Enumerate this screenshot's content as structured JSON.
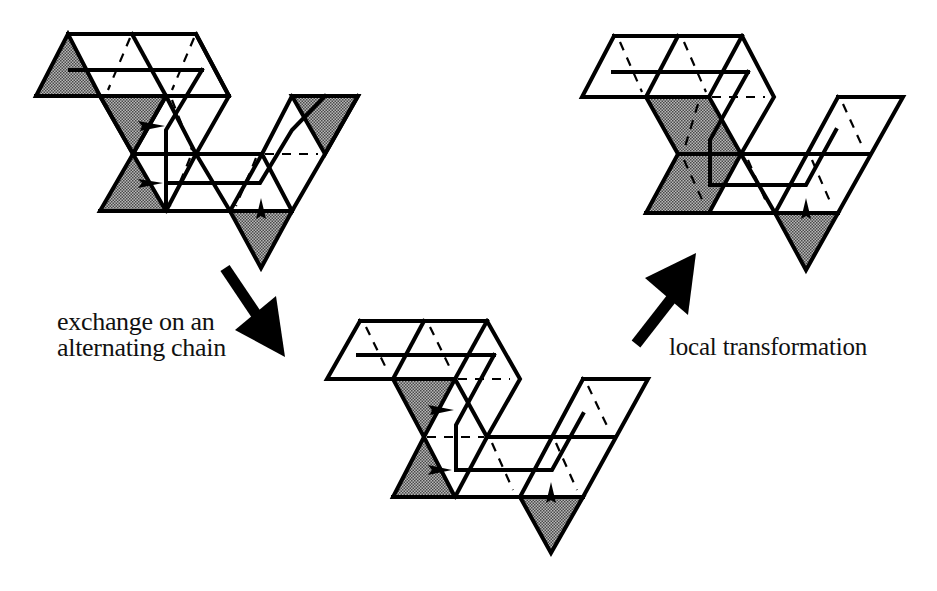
{
  "figure": {
    "type": "scanned-paper-figure",
    "panels": [
      {
        "id": "initial",
        "position": "top-left"
      },
      {
        "id": "intermediate",
        "position": "bottom-center"
      },
      {
        "id": "final",
        "position": "top-right"
      }
    ],
    "arrows": [
      {
        "from": "initial",
        "to": "intermediate",
        "label": "exchange on an alternating chain"
      },
      {
        "from": "intermediate",
        "to": "final",
        "label": "local transformation"
      }
    ]
  },
  "labels": {
    "exchange_line1": "exchange on an",
    "exchange_line2": "alternating chain",
    "local": "local transformation"
  },
  "colors": {
    "ink": "#000000",
    "background": "#ffffff",
    "shade": "#8a8a8a"
  }
}
